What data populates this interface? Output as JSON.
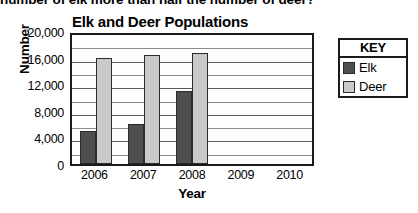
{
  "page": {
    "cropped_top_text": "number of elk more than half the number of deer?"
  },
  "legend": {
    "title": "KEY",
    "entries": [
      {
        "label": "Elk",
        "color": "#4e4e4e",
        "swatch_name": "elk-swatch"
      },
      {
        "label": "Deer",
        "color": "#c9c9c9",
        "swatch_name": "deer-swatch"
      }
    ]
  },
  "chart_data": {
    "type": "bar",
    "title": "Elk and Deer Populations",
    "xlabel": "Year",
    "ylabel": "Number",
    "categories": [
      "2006",
      "2007",
      "2008",
      "2009",
      "2010"
    ],
    "series": [
      {
        "name": "Elk",
        "color": "#4e4e4e",
        "values": [
          5000,
          6000,
          11000,
          null,
          null
        ]
      },
      {
        "name": "Deer",
        "color": "#c9c9c9",
        "values": [
          16000,
          16400,
          16700,
          null,
          null
        ]
      }
    ],
    "ylim": [
      0,
      20000
    ],
    "ytick_labels": [
      "20,000",
      "16,000",
      "12,000",
      "8,000",
      "4,000",
      "0"
    ],
    "ytick_values": [
      20000,
      16000,
      12000,
      8000,
      4000,
      0
    ],
    "minor_tick_interval": 2000,
    "grid": true,
    "legend_position": "right"
  }
}
